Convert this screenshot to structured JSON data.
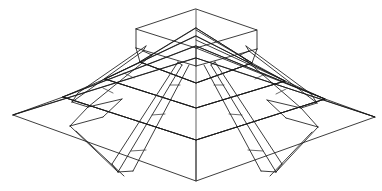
{
  "figure": {
    "title": "Wireframe stepped pyramid (ziggurat)",
    "background_color": "#ffffff",
    "line_color": "#1a1a1a",
    "line_width": "0.85",
    "canvas": {
      "width": 382,
      "height": 191
    },
    "projection": "two-point perspective / isometric-like",
    "element_counts": {
      "tiers": 4,
      "staircases": 4,
      "top_block": 1,
      "axis_lines": 1
    }
  },
  "geometry": {
    "axis": {
      "x": 196,
      "y_top": 9,
      "y_bottom": 181
    },
    "base": {
      "name": "ground-tier-outline",
      "left": [
        13,
        115
      ],
      "right": [
        375,
        117
      ],
      "front": [
        196,
        181
      ],
      "back": [
        196,
        58
      ]
    },
    "tier2": {
      "name": "second-tier-outline",
      "left": [
        63,
        97
      ],
      "right": [
        325,
        99
      ],
      "front": [
        196,
        140
      ],
      "back": [
        196,
        46
      ]
    },
    "tier3": {
      "name": "third-tier-outline",
      "left": [
        105,
        79
      ],
      "right": [
        285,
        81
      ],
      "front": [
        196,
        108
      ],
      "back": [
        196,
        36
      ]
    },
    "tier4": {
      "name": "fourth-tier-outline",
      "left": [
        140,
        62
      ],
      "right": [
        252,
        63
      ],
      "front": [
        196,
        83
      ],
      "back": [
        196,
        28
      ]
    },
    "top_block": {
      "name": "crowning-block",
      "front_left": [
        136,
        29
      ],
      "front_right": [
        257,
        30
      ],
      "back_apex": [
        196,
        9
      ],
      "front_apex": [
        196,
        48
      ],
      "height": 20
    }
  },
  "labels": {
    "axis_label": "",
    "figure_label": "",
    "annotations": []
  }
}
